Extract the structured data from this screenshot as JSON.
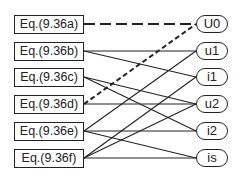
{
  "equations": [
    {
      "id": "a",
      "label": "Eq.(9.36a)",
      "y": 24
    },
    {
      "id": "b",
      "label": "Eq.(9.36b)",
      "y": 51
    },
    {
      "id": "c",
      "label": "Eq.(9.36c)",
      "y": 77
    },
    {
      "id": "d",
      "label": "Eq.(9.36d)",
      "y": 104
    },
    {
      "id": "e",
      "label": "Eq.(9.36e)",
      "y": 131
    },
    {
      "id": "f",
      "label": "Eq.(9.36f)",
      "y": 158
    }
  ],
  "variables": [
    {
      "id": "U0",
      "label": "U0",
      "y": 24
    },
    {
      "id": "u1",
      "label": "u1",
      "y": 51
    },
    {
      "id": "i1",
      "label": "i1",
      "y": 77
    },
    {
      "id": "u2",
      "label": "u2",
      "y": 104
    },
    {
      "id": "i2",
      "label": "i2",
      "y": 131
    },
    {
      "id": "is",
      "label": "is",
      "y": 158
    }
  ],
  "edges": [
    {
      "from": "a",
      "to": "U0",
      "style": "long-dash"
    },
    {
      "from": "d",
      "to": "U0",
      "style": "short-dash"
    },
    {
      "from": "b",
      "to": "u1",
      "style": "solid"
    },
    {
      "from": "b",
      "to": "i1",
      "style": "solid"
    },
    {
      "from": "c",
      "to": "u2",
      "style": "solid"
    },
    {
      "from": "c",
      "to": "i2",
      "style": "solid"
    },
    {
      "from": "d",
      "to": "u2",
      "style": "solid"
    },
    {
      "from": "e",
      "to": "u1",
      "style": "solid"
    },
    {
      "from": "e",
      "to": "i2",
      "style": "solid"
    },
    {
      "from": "e",
      "to": "is",
      "style": "solid"
    },
    {
      "from": "f",
      "to": "i1",
      "style": "solid"
    },
    {
      "from": "f",
      "to": "u2",
      "style": "solid"
    },
    {
      "from": "f",
      "to": "is",
      "style": "solid"
    }
  ],
  "colors": {
    "line": "#222222",
    "background": "#ffffff"
  }
}
